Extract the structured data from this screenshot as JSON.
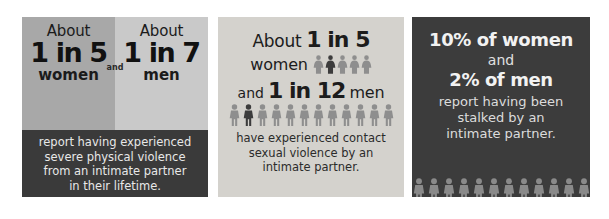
{
  "infographic": {
    "background": "#ffffff",
    "panels": [
      {
        "id": "panel-1",
        "topic": "severe physical violence",
        "bg_left": "#a8a8a8",
        "bg_right": "#c9c9c9",
        "caption_bg": "#3a3a3a",
        "connector": "and",
        "columns": [
          {
            "about": "About",
            "ratio": "1 in 5",
            "group": "women",
            "figure_type": "female",
            "figure_count": 5,
            "highlight_index": 3,
            "figure_color": "#ffffff",
            "highlight_color": "#4a4a4a"
          },
          {
            "about": "About",
            "ratio": "1 in 7",
            "group": "men",
            "figure_type": "male",
            "figure_count": 7,
            "highlight_index": 4,
            "figure_color": "#ffffff",
            "highlight_color": "#3c3c3c"
          }
        ],
        "caption_lines": [
          "report having experienced",
          "severe physical violence",
          "from an intimate partner",
          "in their lifetime."
        ]
      },
      {
        "id": "panel-2",
        "topic": "contact sexual violence",
        "bg": "#d4d2cd",
        "about": "About",
        "women_ratio": "1 in 5",
        "women_word": "women",
        "connector": "and",
        "men_ratio": "1 in 12",
        "men_word": "men",
        "women_figures": {
          "figure_type": "female",
          "figure_count": 5,
          "highlight_index": 2,
          "figure_color": "#8e8e8e",
          "highlight_color": "#3c3c3c"
        },
        "men_figures": {
          "figure_type": "male",
          "figure_count": 12,
          "highlight_index": 2,
          "figure_color": "#8e8e8e",
          "highlight_color": "#3c3c3c"
        },
        "caption_lines": [
          "have experienced contact",
          "sexual violence by an",
          "intimate partner."
        ]
      },
      {
        "id": "panel-3",
        "topic": "stalking",
        "bg": "#3c3c3c",
        "women_stat": "10% of women",
        "connector": "and",
        "men_stat": "2% of men",
        "caption_lines": [
          "report having been",
          "stalked by an",
          "intimate partner."
        ],
        "figures": {
          "figure_type": "male",
          "figure_count": 12,
          "figure_color": "#8a8a8a",
          "highlight_color": "#8a8a8a"
        }
      }
    ]
  }
}
